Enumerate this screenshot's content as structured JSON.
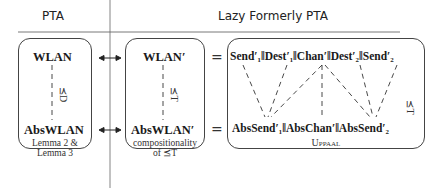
{
  "columns": {
    "left_header": "PTA",
    "right_header": "Lazy Formerly PTA"
  },
  "left_box": {
    "top_term": "WLAN",
    "bottom_term": "AbsWLAN",
    "relation": "⪯D",
    "note_line1": "Lemma 2 &",
    "note_line2": "Lemma 3"
  },
  "middle_box": {
    "top_term": "WLAN′",
    "bottom_term": "AbsWLAN′",
    "relation": "⪯T",
    "note_line1": "compositionality",
    "note_line2": "of ⪯T"
  },
  "right_box": {
    "top_terms": [
      "Send′₁",
      "Dest′₁",
      "Chan′",
      "Dest′₂",
      "Send′₂"
    ],
    "top_expression": "Send′₁‖Dest′₁‖Chan′‖Dest′₂‖Send′₂",
    "bottom_expression": "AbsSend′₁‖AbsChan′‖AbsSend′₂",
    "relation": "⪯T",
    "tool_label": "Uppaal"
  },
  "connectors": {
    "equals_symbol": "=",
    "bidirectional_arrow": "↔"
  }
}
